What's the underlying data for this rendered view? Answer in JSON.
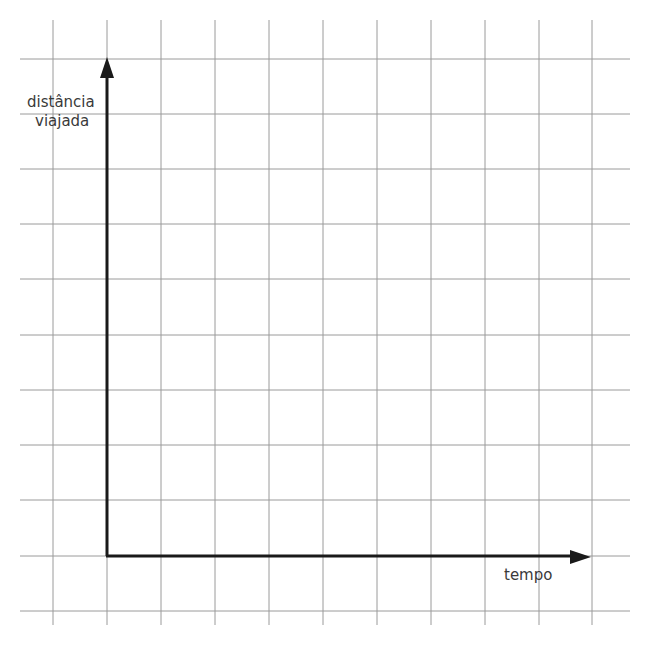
{
  "diagram": {
    "type": "blank-graph-grid",
    "y_axis": {
      "label_line1": "distância",
      "label_line2": "viajada"
    },
    "x_axis": {
      "label": "tempo"
    },
    "grid": {
      "columns": 11,
      "rows": 11,
      "vertical_lines_x": [
        53,
        107,
        161,
        215,
        269,
        323,
        377,
        431,
        485,
        539,
        592
      ],
      "horizontal_lines_y": [
        59,
        114,
        169,
        224,
        279,
        335,
        390,
        445,
        500,
        556,
        611
      ],
      "line_color": "#9a9a9a",
      "axis_color": "#1a1a1a"
    }
  },
  "chart_data": {
    "type": "line",
    "title": "",
    "xlabel": "tempo",
    "ylabel": "distância viajada",
    "series": [],
    "grid": true,
    "ticks": "none"
  }
}
